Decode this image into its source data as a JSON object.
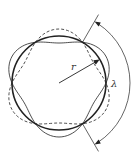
{
  "figure": {
    "labels": {
      "radius": "r",
      "wavelength": "λ"
    },
    "geometry": {
      "center": [
        59,
        83
      ],
      "radius": 47,
      "amplitude": 7,
      "mode": 3
    },
    "colors": {
      "stroke": "#222222",
      "background": "#ffffff"
    }
  }
}
